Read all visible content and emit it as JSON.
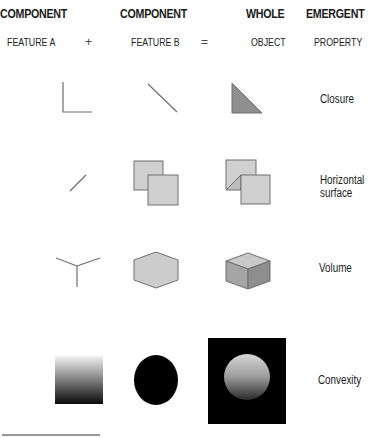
{
  "header": {
    "columns": [
      {
        "title": "COMPONENT",
        "subtitle": "FEATURE A"
      },
      {
        "title": "COMPONENT",
        "subtitle": "FEATURE B"
      },
      {
        "title": "WHOLE",
        "subtitle": "OBJECT"
      },
      {
        "title": "EMERGENT",
        "subtitle": "PROPERTY"
      }
    ],
    "operators": {
      "plus": "+",
      "equals": "="
    }
  },
  "rows": [
    {
      "property": "Closure",
      "feature_a": "corner-lines",
      "feature_b": "diagonal-line",
      "whole": "filled-right-triangle"
    },
    {
      "property_line1": "Horizontal",
      "property_line2": "surface",
      "feature_a": "short-slanted-line",
      "feature_b": "two-overlapping-squares",
      "whole": "overlapping-squares-with-diagonal"
    },
    {
      "property": "Volume",
      "feature_a": "y-junction",
      "feature_b": "hexagon",
      "whole": "shaded-cube"
    },
    {
      "property": "Convexity",
      "feature_a": "vertical-gradient-square",
      "feature_b": "black-ellipse",
      "whole": "shaded-sphere-on-black"
    }
  ],
  "colors": {
    "line": "#6e6e6e",
    "fill_light": "#cfcfcf",
    "fill_mid": "#9a9a9a",
    "fill_dark": "#8a8a8a",
    "black": "#000000"
  }
}
